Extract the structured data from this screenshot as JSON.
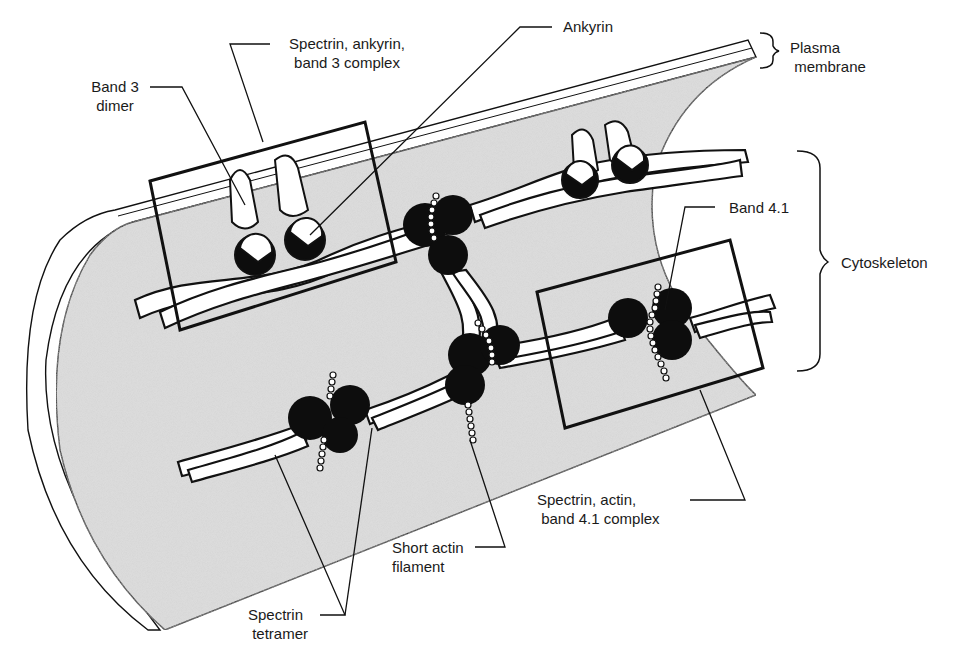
{
  "diagram": {
    "colors": {
      "cytoplasm_fill": "#d9d9d9",
      "stroke": "#111111",
      "protein_dark": "#0d0d0d",
      "protein_light": "#ffffff",
      "background": "#ffffff"
    },
    "labels": {
      "band3_dimer": "Band 3\ndimer",
      "spectrin_ankyrin_band3_complex": "Spectrin, ankyrin,\nband 3 complex",
      "ankyrin": "Ankyrin",
      "plasma_membrane": "Plasma\n membrane",
      "cytoskeleton": "Cytoskeleton",
      "band41": "Band 4.1",
      "spectrin_actin_band41_complex": "Spectrin, actin,\n band 4.1 complex",
      "short_actin_filament": "Short actin\nfilament",
      "spectrin_tetramer": "Spectrin\n tetramer"
    },
    "brackets": [
      {
        "name": "plasma-membrane-bracket",
        "target": "Plasma membrane"
      },
      {
        "name": "cytoskeleton-bracket",
        "target": "Cytoskeleton"
      }
    ],
    "highlight_boxes": [
      {
        "name": "spectrin-ankyrin-band3-box",
        "label": "Spectrin, ankyrin, band 3 complex"
      },
      {
        "name": "spectrin-actin-band41-box",
        "label": "Spectrin, actin, band 4.1 complex"
      }
    ]
  }
}
